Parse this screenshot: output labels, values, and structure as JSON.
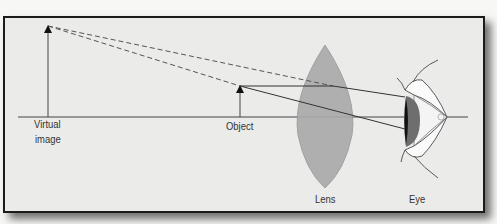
{
  "diagram": {
    "type": "optics-ray-diagram",
    "labels": {
      "virtual_image_line1": "Virtual",
      "virtual_image_line2": "image",
      "object": "Object",
      "lens": "Lens",
      "eye": "Eye"
    },
    "colors": {
      "frame_border": "#1c1c1c",
      "background": "#ebebea",
      "lens_fill": "#a8a8a8",
      "lines": "#333333"
    },
    "elements": [
      {
        "name": "virtual-image-arrow",
        "x": 48,
        "tip_y": 26,
        "base_y": 117
      },
      {
        "name": "object-arrow",
        "x": 240,
        "tip_y": 86,
        "base_y": 117
      },
      {
        "name": "convex-lens",
        "cx": 325,
        "top_y": 45,
        "bottom_y": 188
      },
      {
        "name": "eye",
        "x": 405,
        "axis_y": 117
      },
      {
        "name": "optical-axis",
        "x1": 18,
        "x2": 468,
        "y": 117
      }
    ]
  }
}
